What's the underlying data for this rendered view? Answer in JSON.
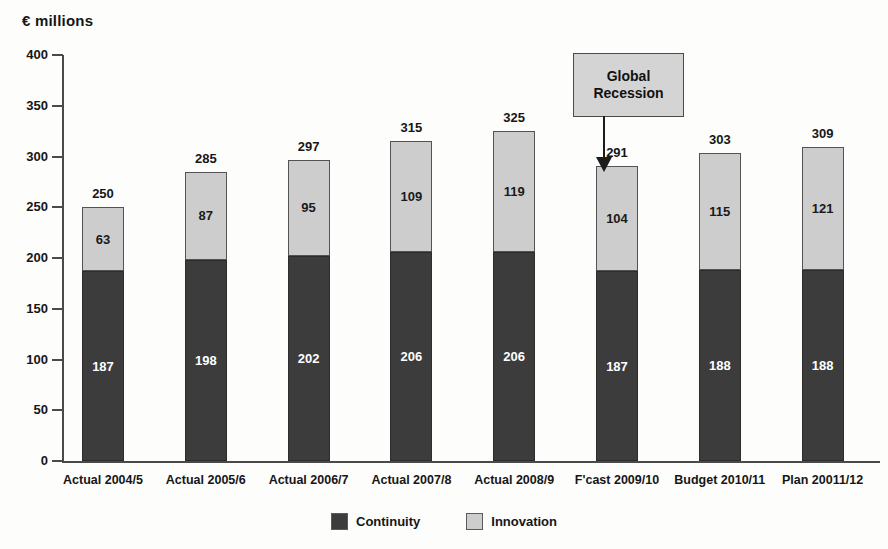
{
  "axis_title": "€ millions",
  "chart_data": {
    "type": "bar",
    "title": "",
    "subtitle": "",
    "xlabel": "",
    "ylabel": "€ millions",
    "ylim": [
      0,
      400
    ],
    "ytick_values": [
      0,
      50,
      100,
      150,
      200,
      250,
      300,
      350,
      400
    ],
    "ytick_labels": [
      "0",
      "50",
      "100",
      "150",
      "200",
      "250",
      "300",
      "350",
      "400"
    ],
    "grid": false,
    "stacked": true,
    "legend_position": "bottom-center",
    "categories": [
      "Actual 2004/5",
      "Actual 2005/6",
      "Actual 2006/7",
      "Actual 2007/8",
      "Actual 2008/9",
      "F'cast 2009/10",
      "Budget 2010/11",
      "Plan 20011/12"
    ],
    "series": [
      {
        "name": "Continuity",
        "color": "#3c3c3c",
        "values": [
          187,
          198,
          202,
          206,
          206,
          187,
          188,
          188
        ]
      },
      {
        "name": "Innovation",
        "color": "#cdcdcd",
        "values": [
          63,
          87,
          95,
          109,
          119,
          104,
          115,
          121
        ]
      }
    ],
    "totals": [
      250,
      285,
      297,
      315,
      325,
      291,
      303,
      309
    ],
    "annotations": [
      {
        "text": "Global Recession",
        "line1": "Global",
        "line2": "Recession",
        "points_to_category": "F'cast 2009/10"
      }
    ]
  },
  "legend": {
    "items": [
      {
        "label": "Continuity",
        "color": "#3c3c3c"
      },
      {
        "label": "Innovation",
        "color": "#cdcdcd"
      }
    ]
  }
}
